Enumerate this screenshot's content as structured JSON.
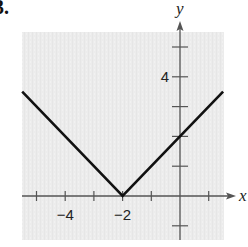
{
  "problem": {
    "number_label": "3."
  },
  "chart_data": {
    "type": "line",
    "title": "",
    "function": "y = |x + 2|",
    "xlabel": "x",
    "ylabel": "y",
    "xlim": [
      -5.5,
      1.9
    ],
    "ylim": [
      -1.5,
      5.8
    ],
    "x_ticks": [
      -5,
      -4,
      -3,
      -2,
      -1,
      1
    ],
    "y_ticks": [
      -1,
      1,
      2,
      3,
      4,
      5
    ],
    "x_tick_labels": [
      {
        "value": -4,
        "label": "−4"
      },
      {
        "value": -2,
        "label": "−2"
      }
    ],
    "y_tick_labels": [
      {
        "value": 4,
        "label": "4"
      }
    ],
    "grid": false,
    "background_color": "#ececec",
    "line_color": "#111111",
    "series": [
      {
        "name": "y = |x + 2|",
        "x": [
          -5.5,
          -2,
          1.5
        ],
        "y": [
          3.5,
          0,
          3.5
        ]
      }
    ],
    "vertex": {
      "x": -2,
      "y": 0
    }
  }
}
